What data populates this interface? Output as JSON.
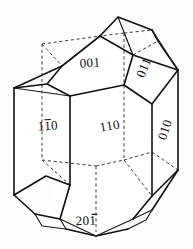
{
  "figure": {
    "kind": "crystal-form-diagram",
    "title": "",
    "background_color": "#fdfdfb",
    "line_color": "#111111",
    "hidden_line_style": "dashed"
  },
  "labels": {
    "top_face": {
      "text": "001",
      "overbar_indices": [],
      "rotation": 0
    },
    "upper_right_face": {
      "text": "011",
      "overbar_indices": [],
      "rotation": -68
    },
    "left_prism_face": {
      "text": "110",
      "overbar_indices": [
        1
      ],
      "rotation": 0
    },
    "front_prism_face": {
      "text": "110",
      "overbar_indices": [],
      "rotation": -8
    },
    "right_prism_face": {
      "text": "010",
      "overbar_indices": [],
      "rotation": -72
    },
    "bottom_face": {
      "text": "201",
      "overbar_indices": [
        2
      ],
      "rotation": 0
    }
  },
  "label_list": [
    {
      "name": "label-001",
      "text": "001"
    },
    {
      "name": "label-011",
      "text": "011"
    },
    {
      "name": "label-1bar10",
      "text": "110"
    },
    {
      "name": "label-110",
      "text": "110"
    },
    {
      "name": "label-010",
      "text": "010"
    },
    {
      "name": "label-20bar1",
      "text": "201"
    }
  ]
}
